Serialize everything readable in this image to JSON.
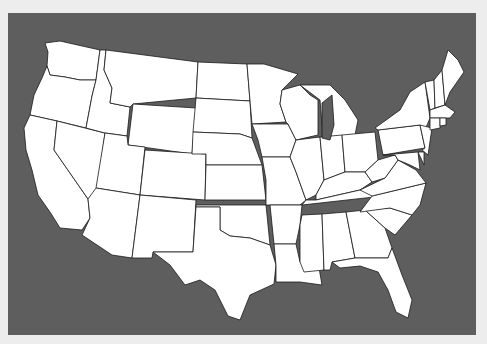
{
  "map": {
    "title": "",
    "region": "Contiguous United States",
    "style": "blank outline map",
    "colors": {
      "page_background": "#ededed",
      "panel_background": "#5e5e5e",
      "state_fill": "#ffffff",
      "state_border": "#1a1a1a"
    },
    "states": [
      {
        "id": "WA",
        "name": "Washington",
        "points": "45,43 60,41 100,50 96,80 80,80 65,77 50,75 47,66 48,52"
      },
      {
        "id": "OR",
        "name": "Oregon",
        "points": "47,66 50,75 65,77 80,80 96,80 92,96 86,128 57,121 30,115 34,95 42,78"
      },
      {
        "id": "CA",
        "name": "California",
        "points": "30,115 57,121 54,150 88,199 90,218 82,230 60,228 50,212 38,195 32,170 26,150 24,128"
      },
      {
        "id": "NV",
        "name": "Nevada",
        "points": "57,121 105,133 96,200 88,199 54,150"
      },
      {
        "id": "ID",
        "name": "Idaho",
        "points": "100,50 106,50 104,70 112,88 110,103 130,107 127,136 105,133 86,128 92,96 96,80"
      },
      {
        "id": "MT",
        "name": "Montana",
        "points": "106,50 198,62 196,98 133,104 130,107 110,103 112,88 104,70"
      },
      {
        "id": "WY",
        "name": "Wyoming",
        "points": "133,104 196,108 192,154 128,145"
      },
      {
        "id": "UT",
        "name": "Utah",
        "points": "105,133 127,136 128,145 145,147 140,195 96,188"
      },
      {
        "id": "CO",
        "name": "Colorado",
        "points": "145,150 206,154 205,200 140,195"
      },
      {
        "id": "AZ",
        "name": "Arizona",
        "points": "96,188 140,195 132,258 112,255 82,235 90,218 88,199"
      },
      {
        "id": "NM",
        "name": "New Mexico",
        "points": "140,195 196,200 193,252 153,252 152,258 132,258"
      },
      {
        "id": "ND",
        "name": "North Dakota",
        "points": "198,62 247,64 250,101 196,98"
      },
      {
        "id": "SD",
        "name": "South Dakota",
        "points": "196,98 250,101 252,138 240,134 193,132"
      },
      {
        "id": "NE",
        "name": "Nebraska",
        "points": "193,132 240,134 252,138 262,165 206,165 206,154 192,154"
      },
      {
        "id": "KS",
        "name": "Kansas",
        "points": "206,165 262,165 266,200 205,200"
      },
      {
        "id": "OK",
        "name": "Oklahoma",
        "points": "196,205 266,205 270,245 250,238 230,236 220,230 220,207 196,207"
      },
      {
        "id": "TX",
        "name": "Texas",
        "points": "196,207 220,207 220,230 230,236 250,238 270,245 276,265 274,284 250,295 240,320 228,316 215,290 200,280 185,285 170,265 153,252 193,252"
      },
      {
        "id": "MN",
        "name": "Minnesota",
        "points": "247,64 264,64 298,74 282,90 280,104 286,122 252,124 250,101"
      },
      {
        "id": "IA",
        "name": "Iowa",
        "points": "252,124 288,124 296,140 290,157 262,157 258,140"
      },
      {
        "id": "MO",
        "name": "Missouri",
        "points": "262,157 290,157 296,172 306,200 300,205 266,205 266,180"
      },
      {
        "id": "AR",
        "name": "Arkansas",
        "points": "270,205 302,205 300,225 296,244 274,244"
      },
      {
        "id": "LA",
        "name": "Louisiana",
        "points": "274,244 296,244 300,262 318,262 322,285 300,282 276,282 276,265"
      },
      {
        "id": "WI",
        "name": "Wisconsin",
        "points": "282,90 300,85 310,95 318,100 318,135 296,140 288,124 286,122 280,104"
      },
      {
        "id": "IL",
        "name": "Illinois",
        "points": "296,140 320,137 324,180 316,195 306,200 296,172 290,157"
      },
      {
        "id": "MI",
        "name": "Michigan",
        "points": "300,85 330,85 345,100 358,120 355,135 330,140 322,125 320,100"
      },
      {
        "id": "IN",
        "name": "Indiana",
        "points": "320,137 342,135 345,172 324,180"
      },
      {
        "id": "OH",
        "name": "Ohio",
        "points": "342,135 375,132 378,160 365,172 345,172"
      },
      {
        "id": "KY",
        "name": "Kentucky",
        "points": "316,195 324,180 345,172 365,172 372,182 360,190 316,200"
      },
      {
        "id": "TN",
        "name": "Tennessee",
        "points": "306,200 316,200 360,190 372,185 402,182 392,195 302,205"
      },
      {
        "id": "MS",
        "name": "Mississippi",
        "points": "302,215 322,214 324,270 304,272 300,262 300,225"
      },
      {
        "id": "AL",
        "name": "Alabama",
        "points": "322,214 346,212 355,258 332,262 330,270 324,270"
      },
      {
        "id": "GA",
        "name": "Georgia",
        "points": "346,212 365,210 385,228 392,248 388,258 355,258"
      },
      {
        "id": "FL",
        "name": "Florida",
        "points": "332,262 355,258 388,258 392,248 402,275 412,300 408,318 396,312 388,290 378,272 360,266 340,268"
      },
      {
        "id": "SC",
        "name": "South Carolina",
        "points": "365,210 390,208 412,215 395,235 385,228"
      },
      {
        "id": "NC",
        "name": "North Carolina",
        "points": "372,196 426,183 420,205 412,215 390,208 360,212"
      },
      {
        "id": "VA",
        "name": "Virginia",
        "points": "360,190 385,178 398,160 416,170 426,183 372,196"
      },
      {
        "id": "WV",
        "name": "West Virginia",
        "points": "365,172 378,160 395,155 398,160 385,178 372,182"
      },
      {
        "id": "PA",
        "name": "Pennsylvania",
        "points": "378,130 420,125 425,148 383,155"
      },
      {
        "id": "NY",
        "name": "New York",
        "points": "375,128 400,110 410,92 425,82 430,118 425,130 420,125 378,130"
      },
      {
        "id": "NJ",
        "name": "New Jersey",
        "points": "420,125 432,128 428,155 422,150 425,148"
      },
      {
        "id": "DE",
        "name": "Delaware",
        "points": "418,152 424,152 424,165"
      },
      {
        "id": "MD",
        "name": "Maryland",
        "points": "383,155 418,152 420,170 410,165 398,160 395,155"
      },
      {
        "id": "VT",
        "name": "Vermont",
        "points": "425,82 434,80 435,108 430,110"
      },
      {
        "id": "NH",
        "name": "New Hampshire",
        "points": "434,80 442,70 445,105 435,108"
      },
      {
        "id": "ME",
        "name": "Maine",
        "points": "442,70 448,50 458,60 464,72 450,92 445,105"
      },
      {
        "id": "MA",
        "name": "Massachusetts",
        "points": "430,110 445,105 455,112 450,118 430,118"
      },
      {
        "id": "CT",
        "name": "Connecticut",
        "points": "430,118 440,118 440,128 430,130"
      },
      {
        "id": "RI",
        "name": "Rhode Island",
        "points": "440,118 446,118 446,125 440,126"
      }
    ],
    "lakes": [
      {
        "id": "lake-michigan",
        "points": "322,103 332,95 334,125 330,140 322,138"
      }
    ]
  }
}
